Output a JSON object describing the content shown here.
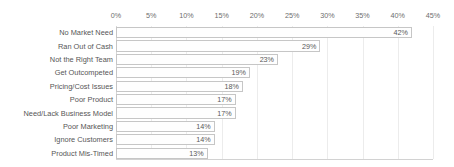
{
  "chart_data": {
    "type": "bar",
    "orientation": "horizontal",
    "title": "",
    "subtitle": "",
    "xlabel": "",
    "ylabel": "",
    "xlim": [
      0,
      45
    ],
    "grid": true,
    "legend": null,
    "legend_position": "none",
    "value_suffix": "%",
    "xticks": [
      "0%",
      "5%",
      "10%",
      "15%",
      "20%",
      "25%",
      "30%",
      "35%",
      "40%",
      "45%"
    ],
    "xtick_values": [
      0,
      5,
      10,
      15,
      20,
      25,
      30,
      35,
      40,
      45
    ],
    "categories": [
      "No Market Need",
      "Ran Out of Cash",
      "Not the Right Team",
      "Get Outcompeted",
      "Pricing/Cost Issues",
      "Poor Product",
      "Need/Lack Business Model",
      "Poor Marketing",
      "Ignore Customers",
      "Product Mis-Timed"
    ],
    "values": [
      42,
      29,
      23,
      19,
      18,
      17,
      17,
      14,
      14,
      13
    ],
    "data_labels": [
      "42%",
      "29%",
      "23%",
      "19%",
      "18%",
      "17%",
      "17%",
      "14%",
      "14%",
      "13%"
    ],
    "colors": {
      "bar_fill": "#fefefe",
      "bar_border": "#c6c6c6",
      "gridline": "#ececec",
      "axis_line": "#d8d8d8",
      "plot_border_bottom": "#d2d2d2",
      "label_text": "#565656",
      "tick_text": "#6d6d6d",
      "value_text": "#585858",
      "background": "#ffffff"
    }
  }
}
